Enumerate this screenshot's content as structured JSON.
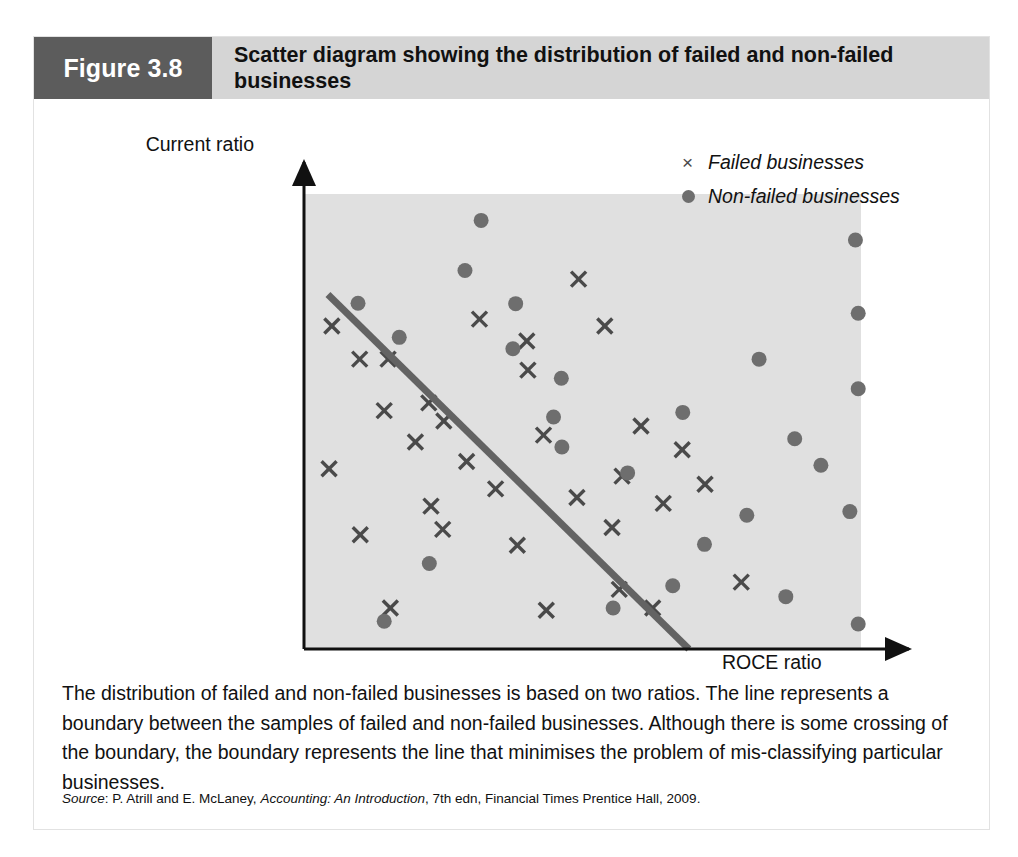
{
  "figure": {
    "number_label": "Figure 3.8",
    "title": "Scatter diagram showing the distribution of failed and non-failed businesses",
    "caption": "The distribution of failed and non-failed businesses is based on two ratios. The line represents a boundary between the samples of failed and non-failed businesses. Although there is some crossing of the boundary, the boundary represents the line that minimises the problem of mis-classifying particular businesses.",
    "source_prefix": "Source",
    "source_rest_1": ": P. Atrill and E. McLaney, ",
    "source_work": "Accounting: An Introduction",
    "source_rest_2": ", 7th edn, Financial Times Prentice Hall, 2009."
  },
  "colors": {
    "band_dark": "#5c5c5c",
    "band_light": "#d5d5d5",
    "plot_background": "#e0e0e0",
    "marker_dot": "#6e6e6e",
    "marker_cross": "#4a4a4a",
    "boundary_line": "#636363",
    "axis": "#111111"
  },
  "legend": {
    "position": "top-right",
    "entries": [
      {
        "marker": "cross-icon",
        "glyph": "×",
        "label": "Failed businesses"
      },
      {
        "marker": "dot-icon",
        "glyph": "●",
        "label": "Non-failed businesses"
      }
    ]
  },
  "chart_data": {
    "type": "scatter",
    "title": "Scatter diagram showing the distribution of failed and non-failed businesses",
    "xlabel": "ROCE ratio",
    "ylabel": "Current ratio",
    "grid": false,
    "axis_ticks": false,
    "xlim": [
      0,
      100
    ],
    "ylim": [
      0,
      100
    ],
    "plot_area_px": {
      "x": 270,
      "y": 157,
      "width": 557,
      "height": 455
    },
    "annotations": [
      {
        "type": "line",
        "name": "boundary-line",
        "label": "Boundary between failed and non-failed samples",
        "x1": 4.3,
        "y1": 77.9,
        "x2": 69.1,
        "y2": 0.0
      }
    ],
    "series": [
      {
        "name": "Failed businesses",
        "marker": "x",
        "color": "#4a4a4a",
        "points": [
          [
            5.0,
            71.0
          ],
          [
            10.0,
            63.7
          ],
          [
            15.1,
            63.7
          ],
          [
            22.4,
            54.1
          ],
          [
            31.5,
            72.5
          ],
          [
            40.0,
            67.7
          ],
          [
            49.3,
            81.3
          ],
          [
            14.4,
            52.4
          ],
          [
            25.1,
            50.1
          ],
          [
            40.2,
            61.3
          ],
          [
            54.0,
            71.0
          ],
          [
            20.0,
            45.5
          ],
          [
            4.5,
            39.6
          ],
          [
            29.2,
            41.2
          ],
          [
            43.0,
            47.0
          ],
          [
            60.5,
            49.0
          ],
          [
            67.9,
            43.8
          ],
          [
            22.8,
            31.4
          ],
          [
            34.4,
            35.2
          ],
          [
            49.0,
            33.3
          ],
          [
            57.1,
            38.0
          ],
          [
            10.1,
            25.1
          ],
          [
            24.9,
            26.3
          ],
          [
            38.3,
            22.8
          ],
          [
            55.3,
            26.7
          ],
          [
            64.5,
            32.0
          ],
          [
            72.0,
            36.2
          ],
          [
            15.5,
            9.0
          ],
          [
            43.5,
            8.5
          ],
          [
            56.6,
            13.1
          ],
          [
            62.6,
            9.0
          ],
          [
            78.5,
            14.7
          ]
        ]
      },
      {
        "name": "Non-failed businesses",
        "marker": "o",
        "color": "#6e6e6e",
        "points": [
          [
            9.7,
            76.0
          ],
          [
            17.1,
            68.5
          ],
          [
            28.9,
            83.2
          ],
          [
            31.8,
            94.2
          ],
          [
            38.0,
            75.9
          ],
          [
            37.5,
            66.0
          ],
          [
            46.2,
            59.5
          ],
          [
            46.3,
            44.4
          ],
          [
            81.7,
            63.7
          ],
          [
            99.0,
            89.9
          ],
          [
            99.5,
            73.8
          ],
          [
            99.5,
            57.2
          ],
          [
            88.1,
            46.2
          ],
          [
            68.0,
            52.0
          ],
          [
            58.1,
            38.7
          ],
          [
            79.5,
            29.4
          ],
          [
            92.8,
            40.4
          ],
          [
            71.9,
            23.0
          ],
          [
            98.0,
            30.2
          ],
          [
            86.5,
            11.5
          ],
          [
            66.2,
            13.9
          ],
          [
            55.5,
            9.0
          ],
          [
            22.5,
            18.8
          ],
          [
            14.4,
            6.1
          ],
          [
            99.5,
            5.5
          ],
          [
            44.8,
            51.0
          ]
        ]
      }
    ]
  }
}
